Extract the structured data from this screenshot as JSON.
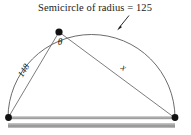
{
  "figure": {
    "caption": "Semicircle of radius = 125",
    "labels": {
      "left_chord": "148",
      "right_chord": "x",
      "angle": "θ"
    },
    "colors": {
      "stroke": "#555555",
      "text": "#1a1a1a",
      "vertex_dot": "#111111",
      "diameter_bar": "#9a9a9a",
      "ground_bar": "#9a9a9a",
      "background": "#ffffff"
    },
    "geometry": {
      "radius_label_value": 125,
      "left_chord_value": 148,
      "arc_left_endpoint": [
        8,
        118
      ],
      "arc_right_endpoint": [
        175,
        118
      ],
      "apex_point": [
        59,
        32
      ],
      "arc_sweep": "semicircle-upper",
      "diameter_y": 118
    },
    "annotations": {
      "arrow_label": "caption-pointer-arrow",
      "arrow_from": [
        128,
        16
      ],
      "arrow_to": [
        117,
        30
      ]
    }
  }
}
